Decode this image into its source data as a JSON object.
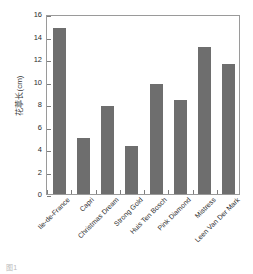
{
  "chart_data": {
    "type": "bar",
    "title": "",
    "subtitle": "",
    "xlabel": "",
    "ylabel": "花葶长(cm)",
    "categories": [
      "Ile-de-France",
      "Capri",
      "Christmas Dream",
      "Strong Gold",
      "Huis Ten Bosch",
      "Pink Diamond",
      "Mistress",
      "Leen Van Der Mark"
    ],
    "values": [
      14.8,
      5.0,
      7.85,
      4.25,
      9.8,
      8.35,
      13.1,
      11.6
    ],
    "ylim": [
      0,
      16
    ],
    "ytick_labels": [
      "0",
      "2",
      "4",
      "6",
      "8",
      "10",
      "12",
      "14",
      "16"
    ],
    "ytick_values": [
      0,
      2,
      4,
      6,
      8,
      10,
      12,
      14,
      16
    ],
    "grid": false,
    "legend": null,
    "legend_position": "none",
    "bar_color": "#6e6e6e",
    "frame_color": "#9a9a9a",
    "background": "#ffffff"
  },
  "caption": "图1"
}
